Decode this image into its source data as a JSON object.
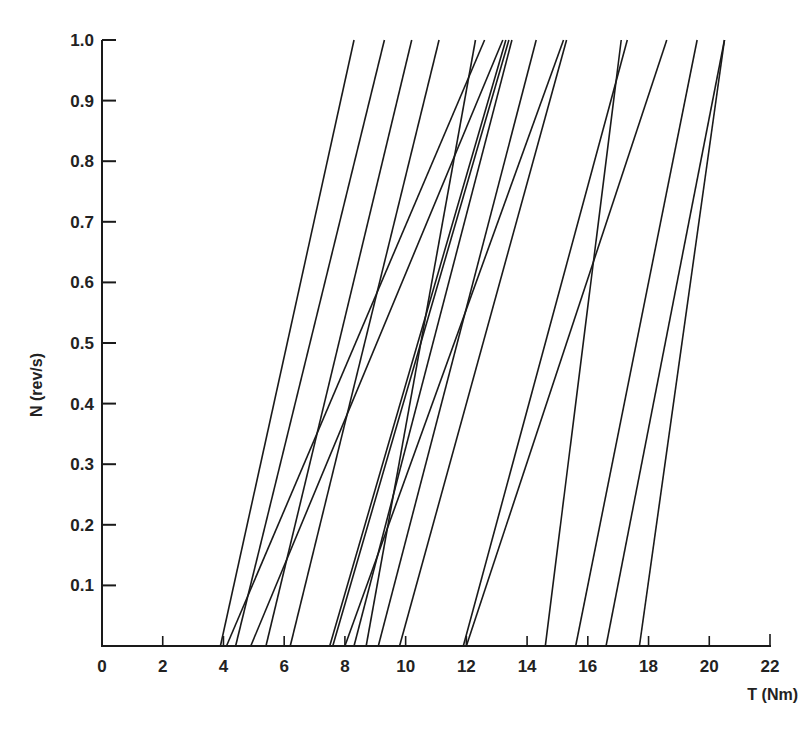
{
  "chart_data": {
    "type": "line",
    "title": "",
    "xlabel": "T (Nm)",
    "ylabel": "N (rev/s)",
    "xlim": [
      0,
      22
    ],
    "ylim": [
      0,
      1.0
    ],
    "x_ticks": [
      0,
      2,
      4,
      6,
      8,
      10,
      12,
      14,
      16,
      18,
      20,
      22
    ],
    "y_ticks": [
      0.1,
      0.2,
      0.3,
      0.4,
      0.5,
      0.6,
      0.7,
      0.8,
      0.9,
      1.0
    ],
    "x_tick_labels": [
      "0",
      "2",
      "4",
      "6",
      "8",
      "10",
      "12",
      "14",
      "16",
      "18",
      "20",
      "22"
    ],
    "y_tick_labels": [
      "0.1",
      "0.2",
      "0.3",
      "0.4",
      "0.5",
      "0.6",
      "0.7",
      "0.8",
      "0.9",
      "1.0"
    ],
    "grid": false,
    "legend": null,
    "line_color": "#1a1a1a",
    "series": [
      {
        "name": "line-1",
        "T_at_N0": 3.9,
        "T_at_N1": 8.3
      },
      {
        "name": "line-2",
        "T_at_N0": 4.1,
        "T_at_N1": 12.6
      },
      {
        "name": "line-3",
        "T_at_N0": 4.4,
        "T_at_N1": 9.3
      },
      {
        "name": "line-4",
        "T_at_N0": 4.9,
        "T_at_N1": 13.2
      },
      {
        "name": "line-5",
        "T_at_N0": 5.4,
        "T_at_N1": 10.2
      },
      {
        "name": "line-6",
        "T_at_N0": 6.2,
        "T_at_N1": 11.1
      },
      {
        "name": "line-7",
        "T_at_N0": 7.5,
        "T_at_N1": 13.3
      },
      {
        "name": "line-8",
        "T_at_N0": 7.6,
        "T_at_N1": 13.4
      },
      {
        "name": "line-9",
        "T_at_N0": 8.0,
        "T_at_N1": 15.2
      },
      {
        "name": "line-10",
        "T_at_N0": 8.3,
        "T_at_N1": 13.5
      },
      {
        "name": "line-11",
        "T_at_N0": 8.7,
        "T_at_N1": 12.3
      },
      {
        "name": "line-12",
        "T_at_N0": 9.1,
        "T_at_N1": 14.3
      },
      {
        "name": "line-13",
        "T_at_N0": 9.8,
        "T_at_N1": 15.3
      },
      {
        "name": "line-14",
        "T_at_N0": 11.9,
        "T_at_N1": 17.3
      },
      {
        "name": "line-15",
        "T_at_N0": 12.0,
        "T_at_N1": 18.6
      },
      {
        "name": "line-16",
        "T_at_N0": 14.6,
        "T_at_N1": 17.1
      },
      {
        "name": "line-17",
        "T_at_N0": 15.6,
        "T_at_N1": 19.6
      },
      {
        "name": "line-18",
        "T_at_N0": 16.6,
        "T_at_N1": 20.5
      },
      {
        "name": "line-19",
        "T_at_N0": 17.7,
        "T_at_N1": 20.5
      }
    ]
  }
}
